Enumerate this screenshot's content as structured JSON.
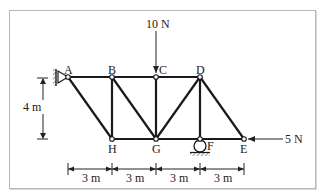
{
  "nodes": {
    "A": {
      "label": "A",
      "x": 68,
      "y": 77
    },
    "B": {
      "label": "B",
      "x": 112,
      "y": 77
    },
    "C": {
      "label": "C",
      "x": 156,
      "y": 77
    },
    "D": {
      "label": "D",
      "x": 200,
      "y": 77
    },
    "H": {
      "label": "H",
      "x": 112,
      "y": 139
    },
    "G": {
      "label": "G",
      "x": 156,
      "y": 139
    },
    "F": {
      "label": "F",
      "x": 200,
      "y": 139
    },
    "E": {
      "label": "E",
      "x": 244,
      "y": 139
    }
  },
  "members": [
    "A-B",
    "B-C",
    "C-D",
    "H-G",
    "G-F",
    "F-E",
    "A-H",
    "B-H",
    "B-G",
    "C-G",
    "D-G",
    "D-F",
    "D-E"
  ],
  "supports": {
    "A": "pin",
    "F": "roller"
  },
  "loads": [
    {
      "node": "C",
      "label": "10 N",
      "direction": "down"
    },
    {
      "node": "E",
      "label": "5 N",
      "direction": "left"
    }
  ],
  "dimensions": {
    "height": "4 m",
    "spans": [
      "3 m",
      "3 m",
      "3 m",
      "3 m"
    ]
  },
  "colors": {
    "member": "#1a1a1a",
    "frame": "#b8b8b8",
    "text": "#222222"
  }
}
